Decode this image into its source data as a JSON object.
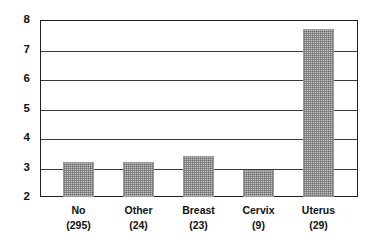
{
  "chart_data": {
    "type": "bar",
    "title": "",
    "subtitle": "",
    "xlabel": "",
    "ylabel": "",
    "categories": [
      "No",
      "Other",
      "Breast",
      "Cervix",
      "Uterus"
    ],
    "category_counts": [
      "(295)",
      "(24)",
      "(23)",
      "(9)",
      "(29)"
    ],
    "values": [
      3.2,
      3.2,
      3.4,
      2.9,
      7.7
    ],
    "ylim": [
      2,
      8
    ],
    "yticks": [
      "2",
      "3",
      "4",
      "5",
      "6",
      "7",
      "8"
    ],
    "ytick_values": [
      2,
      3,
      4,
      5,
      6,
      7,
      8
    ],
    "grid": "horizontal",
    "legend": "none",
    "series": [
      {
        "name": "",
        "values": [
          3.2,
          3.2,
          3.4,
          2.9,
          7.7
        ]
      }
    ],
    "annotations": []
  },
  "axis": {
    "y_labels": [
      "8",
      "7",
      "6",
      "5",
      "4",
      "3",
      "2"
    ]
  },
  "bars": [
    {
      "label": "No",
      "count": "(295)",
      "value": 3.2
    },
    {
      "label": "Other",
      "count": "(24)",
      "value": 3.2
    },
    {
      "label": "Breast",
      "count": "(23)",
      "value": 3.4
    },
    {
      "label": "Cervix",
      "count": "(9)",
      "value": 2.9
    },
    {
      "label": "Uterus",
      "count": "(29)",
      "value": 7.7
    }
  ],
  "colors": {
    "bar_fill": "#c9c9c9",
    "bar_pattern": "#5a5a5a",
    "axis": "#231f20",
    "gridline": "#3a3a3a",
    "text": "#111111",
    "background": "#ffffff"
  }
}
